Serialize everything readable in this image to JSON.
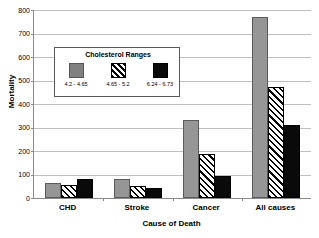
{
  "chart_data": {
    "type": "bar",
    "title": "",
    "xlabel": "Cause of Death",
    "ylabel": "Mortality",
    "categories": [
      "CHD",
      "Stroke",
      "Cancer",
      "All causes"
    ],
    "series": [
      {
        "name": "4.2 - 4.65",
        "color": "#969696",
        "pattern": "solid-gray",
        "values": [
          65,
          82,
          330,
          770
        ]
      },
      {
        "name": "4.65 - 5.2",
        "color": "#000000",
        "pattern": "diagonal-hatch",
        "values": [
          55,
          52,
          188,
          472
        ]
      },
      {
        "name": "6.24 - 6.73",
        "color": "#000000",
        "pattern": "solid-black",
        "values": [
          80,
          41,
          92,
          312
        ]
      }
    ],
    "ylim": [
      0,
      800
    ],
    "yticks": [
      0,
      100,
      200,
      300,
      400,
      500,
      600,
      700,
      800
    ],
    "ytick_labels": [
      "0",
      "100",
      "200",
      "300",
      "400",
      "500",
      "600",
      "700",
      "800"
    ],
    "grid": true,
    "legend": {
      "title": "Cholesterol Ranges",
      "position": "inside-upper-left",
      "entries": [
        "4.2 - 4.65",
        "4.65 - 5.2",
        "6.24 - 6.73"
      ]
    }
  }
}
